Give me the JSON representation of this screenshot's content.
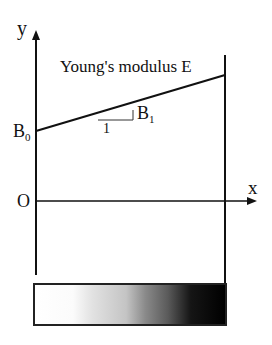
{
  "diagram": {
    "axes": {
      "y_label": "y",
      "x_label": "x",
      "origin_label": "O"
    },
    "curve": {
      "title": "Young's modulus E",
      "intercept_label": "B",
      "intercept_sub": "0",
      "slope_label": "B",
      "slope_sub": "1",
      "run_label": "1"
    },
    "gradient_bar": {
      "description": "material gradient from white (left) to black (right)",
      "start_color": "#ffffff",
      "end_color": "#000000"
    }
  }
}
